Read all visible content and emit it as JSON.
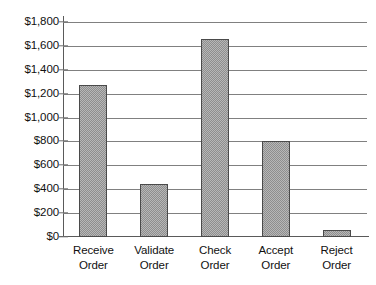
{
  "chart_data": {
    "type": "bar",
    "title": "",
    "xlabel": "",
    "ylabel": "",
    "categories": [
      "Receive Order",
      "Validate Order",
      "Check Order",
      "Accept Order",
      "Reject Order"
    ],
    "category_lines": [
      [
        "Receive",
        "Order"
      ],
      [
        "Validate",
        "Order"
      ],
      [
        "Check",
        "Order"
      ],
      [
        "Accept",
        "Order"
      ],
      [
        "Reject",
        "Order"
      ]
    ],
    "values": [
      1270,
      440,
      1660,
      800,
      60
    ],
    "ylim": [
      0,
      1800
    ],
    "ytick_values": [
      0,
      200,
      400,
      600,
      800,
      1000,
      1200,
      1400,
      1600,
      1800
    ],
    "ytick_labels": [
      "$0",
      "$200",
      "$400",
      "$600",
      "$800",
      "$1,000",
      "$1,200",
      "$1,400",
      "$1,600",
      "$1,800"
    ],
    "grid": true,
    "legend": false,
    "colors": {
      "bar_fill": "#b7b7b7",
      "bar_pattern": "#8e8e8e",
      "bar_border": "#4a4a4a",
      "gridline": "#808080",
      "axis": "#5a5a5a",
      "text": "#111111",
      "background": "#ffffff"
    }
  }
}
